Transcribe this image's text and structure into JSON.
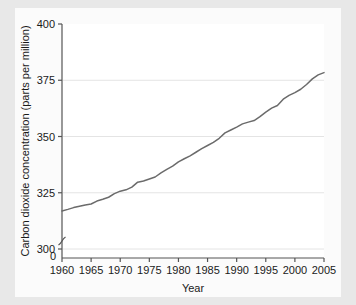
{
  "figure": {
    "background_color": "#e8e8e8",
    "panel_color": "#fbfbfb",
    "plot_background": "#ffffff"
  },
  "chart_data": {
    "type": "line",
    "title": "",
    "xlabel": "Year",
    "ylabel": "Carbon dioxide concentration (parts per million)",
    "xlim": [
      1960,
      2005
    ],
    "ylim": [
      296,
      400
    ],
    "xticks": [
      1960,
      1965,
      1970,
      1975,
      1980,
      1985,
      1990,
      1995,
      2000,
      2005
    ],
    "xtick_labels": [
      "1960",
      "1965",
      "1970",
      "1975",
      "1980",
      "1985",
      "1990",
      "1995",
      "2000",
      "2005"
    ],
    "yticks": [
      300,
      325,
      350,
      375,
      400
    ],
    "ytick_labels": [
      "300",
      "325",
      "350",
      "375",
      "400"
    ],
    "y_origin_label": "0",
    "axis_break": true,
    "grid": "horizontal",
    "legend": "none",
    "line_color": "#6b6b6b",
    "series": [
      {
        "name": "Atmospheric CO2 concentration",
        "x": [
          1960,
          1961,
          1962,
          1963,
          1964,
          1965,
          1966,
          1967,
          1968,
          1969,
          1970,
          1971,
          1972,
          1973,
          1974,
          1975,
          1976,
          1977,
          1978,
          1979,
          1980,
          1981,
          1982,
          1983,
          1984,
          1985,
          1986,
          1987,
          1988,
          1989,
          1990,
          1991,
          1992,
          1993,
          1994,
          1995,
          1996,
          1997,
          1998,
          1999,
          2000,
          2001,
          2002,
          2003,
          2004,
          2005
        ],
        "values": [
          316.9,
          317.6,
          318.4,
          319.0,
          319.6,
          320.0,
          321.3,
          322.1,
          323.0,
          324.6,
          325.7,
          326.3,
          327.5,
          329.7,
          330.2,
          331.1,
          332.0,
          333.8,
          335.4,
          336.8,
          338.7,
          340.1,
          341.4,
          343.0,
          344.6,
          346.0,
          347.4,
          349.2,
          351.6,
          352.9,
          354.2,
          355.6,
          356.4,
          357.1,
          358.8,
          360.8,
          362.6,
          363.8,
          366.6,
          368.3,
          369.5,
          371.0,
          373.1,
          375.6,
          377.4,
          378.4
        ]
      }
    ]
  }
}
